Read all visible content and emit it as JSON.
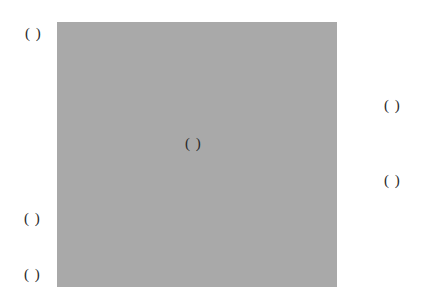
{
  "diagram": {
    "panel_color": "#a9a9a9",
    "labels": {
      "top_left": "( )",
      "center": "( )",
      "right_upper": "( )",
      "right_lower": "( )",
      "left_lower_upper": "( )",
      "left_lower_bottom": "( )"
    }
  }
}
